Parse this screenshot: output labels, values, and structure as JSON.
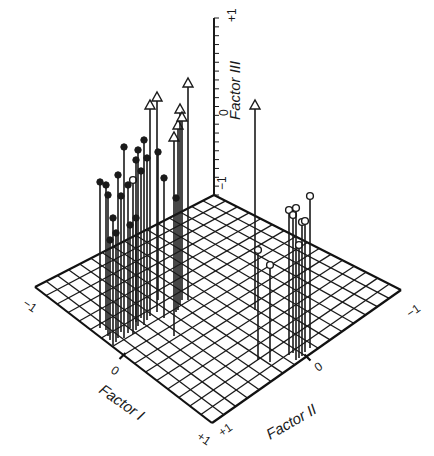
{
  "chart_data": {
    "type": "scatter",
    "subtype": "3d-stem-plot",
    "title": "",
    "axes": {
      "x": {
        "label": "Factor I",
        "ticks": [
          "-1",
          "0",
          "+1"
        ],
        "range": [
          -1,
          1
        ]
      },
      "y": {
        "label": "Factor II",
        "ticks": [
          "-1",
          "0",
          "+1"
        ],
        "range": [
          -1,
          1
        ]
      },
      "z": {
        "label": "Factor III",
        "ticks": [
          "-1",
          "0",
          "+1"
        ],
        "range": [
          -1,
          1
        ]
      }
    },
    "grid": true,
    "legend": null,
    "marker_types": [
      "filled-circle",
      "open-circle",
      "open-arrow"
    ],
    "series": [
      {
        "name": "filled-circle",
        "note": "points with heads at Factor III within range (left cluster)",
        "points": [
          {
            "factor_i": -0.35,
            "factor_ii": -0.05,
            "factor_iii": 0.1
          },
          {
            "factor_i": -0.3,
            "factor_ii": 0.0,
            "factor_iii": 0.15
          },
          {
            "factor_i": -0.25,
            "factor_ii": 0.05,
            "factor_iii": 0.05
          },
          {
            "factor_i": -0.4,
            "factor_ii": -0.1,
            "factor_iii": -0.1
          },
          {
            "factor_i": -0.2,
            "factor_ii": 0.1,
            "factor_iii": -0.2
          },
          {
            "factor_i": -0.45,
            "factor_ii": -0.2,
            "factor_iii": -0.3
          },
          {
            "factor_i": -0.15,
            "factor_ii": 0.15,
            "factor_iii": -0.35
          },
          {
            "factor_i": -0.3,
            "factor_ii": 0.2,
            "factor_iii": -0.5
          },
          {
            "factor_i": -0.1,
            "factor_ii": 0.05,
            "factor_iii": -0.6
          },
          {
            "factor_i": 0.05,
            "factor_ii": 0.3,
            "factor_iii": -0.45
          }
        ]
      },
      {
        "name": "open-circle",
        "note": "right cluster and scattered points",
        "points": [
          {
            "factor_i": -0.8,
            "factor_ii": 0.55,
            "factor_iii": -0.3
          },
          {
            "factor_i": -0.7,
            "factor_ii": 0.6,
            "factor_iii": -0.25
          },
          {
            "factor_i": -0.75,
            "factor_ii": 0.5,
            "factor_iii": -0.4
          },
          {
            "factor_i": -0.65,
            "factor_ii": 0.55,
            "factor_iii": -0.45
          },
          {
            "factor_i": -0.6,
            "factor_ii": 0.6,
            "factor_iii": -0.55
          },
          {
            "factor_i": -0.4,
            "factor_ii": 0.35,
            "factor_iii": -0.55
          },
          {
            "factor_i": -0.35,
            "factor_ii": 0.45,
            "factor_iii": -0.65
          },
          {
            "factor_i": -0.3,
            "factor_ii": -0.15,
            "factor_iii": -0.4
          }
        ]
      },
      {
        "name": "open-arrow",
        "note": "Factor III exceeds +1 (off-scale, arrow heads)",
        "points": [
          {
            "factor_i": -0.2,
            "factor_ii": 0.0,
            "factor_iii": "> +1"
          },
          {
            "factor_i": -0.15,
            "factor_ii": 0.05,
            "factor_iii": "> +1"
          },
          {
            "factor_i": 0.1,
            "factor_ii": 0.15,
            "factor_iii": "> +1"
          },
          {
            "factor_i": 0.2,
            "factor_ii": 0.3,
            "factor_iii": "> +1"
          },
          {
            "factor_i": 0.25,
            "factor_ii": 0.35,
            "factor_iii": "> +1"
          },
          {
            "factor_i": 0.3,
            "factor_ii": 0.25,
            "factor_iii": "> +1"
          },
          {
            "factor_i": 0.35,
            "factor_ii": 0.3,
            "factor_iii": "> +1"
          },
          {
            "factor_i": -0.6,
            "factor_ii": 0.2,
            "factor_iii": "> +1"
          }
        ]
      }
    ]
  },
  "render": {
    "plane": {
      "back": [
        214,
        195
      ],
      "left": [
        35,
        287
      ],
      "front": [
        212,
        423
      ],
      "right": [
        401,
        290
      ],
      "divisions": 16
    },
    "z_axis": {
      "x": 214,
      "top": 18,
      "bottom": 195,
      "ticks": 20
    },
    "labels": {
      "z_title": {
        "text": "Factor III",
        "x": 240,
        "y": 120
      },
      "z_plus": {
        "text": "+1",
        "x": 236,
        "y": 22
      },
      "z_zero": {
        "text": "0",
        "x": 228,
        "y": 116
      },
      "z_minus": {
        "text": "−1",
        "x": 226,
        "y": 190
      },
      "i_minus": {
        "text": "−1",
        "x": 22,
        "y": 305
      },
      "i_zero": {
        "text": "0",
        "x": 110,
        "y": 372
      },
      "i_plus": {
        "text": "+1",
        "x": 196,
        "y": 438
      },
      "i_title": {
        "text": "Factor I",
        "x": 98,
        "y": 392
      },
      "ii_plus": {
        "text": "+1",
        "x": 222,
        "y": 437
      },
      "ii_zero": {
        "text": "0",
        "x": 318,
        "y": 372
      },
      "ii_minus": {
        "text": "−1",
        "x": 410,
        "y": 318
      },
      "ii_title": {
        "text": "Factor II",
        "x": 270,
        "y": 440
      }
    },
    "stems": [
      {
        "x": 100,
        "base": 328,
        "top": 182,
        "head": "filled"
      },
      {
        "x": 106,
        "base": 330,
        "top": 185,
        "head": "filled"
      },
      {
        "x": 108,
        "base": 336,
        "top": 195,
        "head": "filled"
      },
      {
        "x": 110,
        "base": 340,
        "top": 240,
        "head": "filled"
      },
      {
        "x": 113,
        "base": 345,
        "top": 218,
        "head": "filled"
      },
      {
        "x": 116,
        "base": 342,
        "top": 233,
        "head": "filled"
      },
      {
        "x": 118,
        "base": 338,
        "top": 175,
        "head": "filled"
      },
      {
        "x": 121,
        "base": 332,
        "top": 196,
        "head": "filled"
      },
      {
        "x": 124,
        "base": 338,
        "top": 147,
        "head": "filled"
      },
      {
        "x": 128,
        "base": 333,
        "top": 185,
        "head": "filled"
      },
      {
        "x": 130,
        "base": 328,
        "top": 225,
        "head": "filled"
      },
      {
        "x": 133,
        "base": 334,
        "top": 180,
        "head": "open"
      },
      {
        "x": 136,
        "base": 330,
        "top": 218,
        "head": "filled"
      },
      {
        "x": 136,
        "base": 322,
        "top": 160,
        "head": "filled"
      },
      {
        "x": 138,
        "base": 326,
        "top": 150,
        "head": "filled"
      },
      {
        "x": 141,
        "base": 318,
        "top": 171,
        "head": "filled"
      },
      {
        "x": 144,
        "base": 325,
        "top": 140,
        "head": "filled"
      },
      {
        "x": 147,
        "base": 320,
        "top": 158,
        "head": "filled"
      },
      {
        "x": 150,
        "base": 316,
        "top": 100,
        "head": "arrow"
      },
      {
        "x": 157,
        "base": 312,
        "top": 92,
        "head": "arrow"
      },
      {
        "x": 158,
        "base": 300,
        "top": 152,
        "head": "filled"
      },
      {
        "x": 164,
        "base": 318,
        "top": 178,
        "head": "filled"
      },
      {
        "x": 174,
        "base": 336,
        "top": 132,
        "head": "arrow"
      },
      {
        "x": 178,
        "base": 310,
        "top": 120,
        "head": "arrow"
      },
      {
        "x": 180,
        "base": 305,
        "top": 104,
        "head": "arrow"
      },
      {
        "x": 182,
        "base": 300,
        "top": 112,
        "head": "arrow"
      },
      {
        "x": 188,
        "base": 300,
        "top": 78,
        "head": "arrow"
      },
      {
        "x": 176,
        "base": 312,
        "top": 198,
        "head": "filled"
      },
      {
        "x": 255,
        "base": 310,
        "top": 100,
        "head": "arrow"
      },
      {
        "x": 258,
        "base": 360,
        "top": 250,
        "head": "open"
      },
      {
        "x": 270,
        "base": 362,
        "top": 265,
        "head": "open"
      },
      {
        "x": 289,
        "base": 355,
        "top": 210,
        "head": "open"
      },
      {
        "x": 293,
        "base": 353,
        "top": 215,
        "head": "open"
      },
      {
        "x": 296,
        "base": 360,
        "top": 208,
        "head": "open"
      },
      {
        "x": 299,
        "base": 358,
        "top": 245,
        "head": "open"
      },
      {
        "x": 302,
        "base": 356,
        "top": 222,
        "head": "open"
      },
      {
        "x": 305,
        "base": 352,
        "top": 221,
        "head": "open"
      },
      {
        "x": 310,
        "base": 348,
        "top": 196,
        "head": "open"
      }
    ]
  }
}
